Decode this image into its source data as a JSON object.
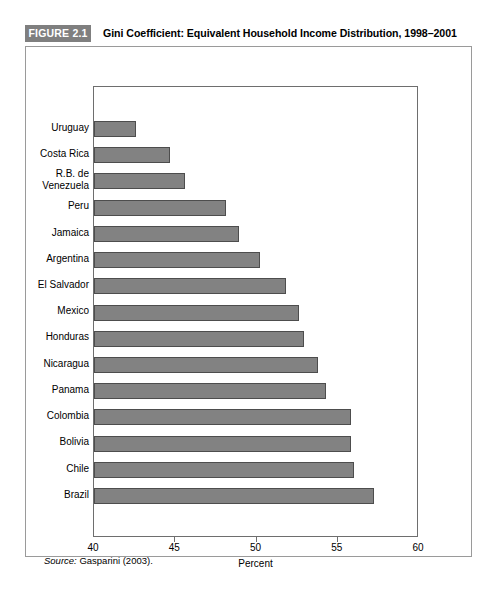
{
  "figure": {
    "badge": "FIGURE 2.1",
    "title": "Gini Coefficient: Equivalent Household Income Distribution, 1998–2001",
    "source_label": "Source:",
    "source_text": "Gasparini (2003)."
  },
  "colors": {
    "badge_background": "#7f7f7f",
    "badge_text": "#ffffff",
    "bar_fill": "#828282",
    "bar_border": "#4d4d4d",
    "frame_border": "#6e6e6e",
    "panel_border": "#9a9a9a"
  },
  "chart_data": {
    "type": "bar",
    "orientation": "horizontal",
    "title": "Gini Coefficient: Equivalent Household Income Distribution, 1998–2001",
    "xlabel": "Percent",
    "ylabel": "",
    "xlim": [
      40,
      60
    ],
    "xticks": [
      40,
      45,
      50,
      55,
      60
    ],
    "xticklabels": [
      "40",
      "45",
      "50",
      "55",
      "60"
    ],
    "grid": false,
    "legend": false,
    "categories": [
      "Uruguay",
      "Costa Rica",
      "R.B. de\nVenezuela",
      "Peru",
      "Jamaica",
      "Argentina",
      "El Salvador",
      "Mexico",
      "Honduras",
      "Nicaragua",
      "Panama",
      "Colombia",
      "Bolivia",
      "Chile",
      "Brazil"
    ],
    "values": [
      42.6,
      44.7,
      45.6,
      48.1,
      48.9,
      50.2,
      51.8,
      52.6,
      52.9,
      53.8,
      54.3,
      55.8,
      55.8,
      56.0,
      57.2
    ]
  }
}
